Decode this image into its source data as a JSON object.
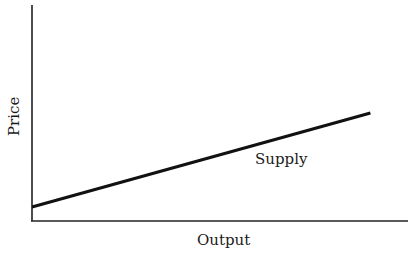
{
  "chart_data": {
    "type": "line",
    "title": "",
    "xlabel": "Output",
    "ylabel": "Price",
    "grid": false,
    "legend": "none",
    "ticks": {
      "x": [],
      "y": []
    },
    "xlim": [
      0,
      1
    ],
    "ylim": [
      0,
      1
    ],
    "series": [
      {
        "name": "Supply",
        "x": [
          0,
          0.9
        ],
        "y": [
          0.065,
          0.5
        ],
        "color": "#111111"
      }
    ],
    "annotations": [
      {
        "text": "Supply",
        "x": 0.6,
        "y": 0.27
      }
    ]
  },
  "labels": {
    "x_axis": "Output",
    "y_axis": "Price",
    "curve": "Supply"
  }
}
